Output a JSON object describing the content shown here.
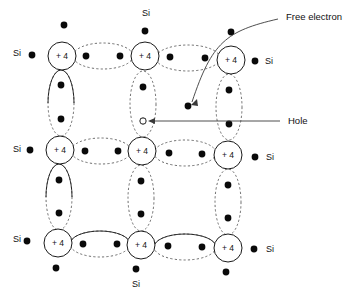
{
  "figure": {
    "background_color": "#ffffff",
    "line_color": "#1a1a1a",
    "dash_color": "#4a4a4a",
    "dot_color": "#0a0a0a"
  },
  "atoms": [
    {
      "id": "atom-r0c0",
      "label": "+ 4",
      "cx": 62,
      "cy": 56,
      "r": 14
    },
    {
      "id": "atom-r0c1",
      "label": "+ 4",
      "cx": 145,
      "cy": 56,
      "r": 14
    },
    {
      "id": "atom-r0c2",
      "label": "+ 4",
      "cx": 231,
      "cy": 60,
      "r": 14
    },
    {
      "id": "atom-r1c0",
      "label": "+ 4",
      "cx": 60,
      "cy": 150,
      "r": 14
    },
    {
      "id": "atom-r1c1",
      "label": "+ 4",
      "cx": 142,
      "cy": 151,
      "r": 14
    },
    {
      "id": "atom-r1c2",
      "label": "+ 4",
      "cx": 228,
      "cy": 155,
      "r": 14
    },
    {
      "id": "atom-r2c0",
      "label": "+ 4",
      "cx": 58,
      "cy": 243,
      "r": 14
    },
    {
      "id": "atom-r2c1",
      "label": "+ 4",
      "cx": 141,
      "cy": 245,
      "r": 14
    },
    {
      "id": "atom-r2c2",
      "label": "+ 4",
      "cx": 228,
      "cy": 248,
      "r": 14
    }
  ],
  "si_labels": [
    {
      "id": "si-top",
      "text": "Si",
      "x": 146,
      "y": 14
    },
    {
      "id": "si-left-top",
      "text": "Si",
      "x": 17,
      "y": 54
    },
    {
      "id": "si-right-top",
      "text": "Si",
      "x": 269,
      "y": 62
    },
    {
      "id": "si-left-middle",
      "text": "Si",
      "x": 17,
      "y": 150
    },
    {
      "id": "si-right-middle",
      "text": "Si",
      "x": 270,
      "y": 158
    },
    {
      "id": "si-left-bottom",
      "text": "Si",
      "x": 17,
      "y": 240
    },
    {
      "id": "si-right-bottom",
      "text": "Si",
      "x": 270,
      "y": 250
    },
    {
      "id": "si-bottom",
      "text": "Si",
      "x": 136,
      "y": 285
    }
  ],
  "callouts": [
    {
      "id": "free-electron-callout",
      "label": "Free electron",
      "label_x": 286,
      "label_y": 17,
      "target_x": 190,
      "target_y": 104
    },
    {
      "id": "hole-callout",
      "label": "Hole",
      "label_x": 288,
      "label_y": 121,
      "target_x": 150,
      "target_y": 121
    }
  ],
  "free_electron": {
    "id": "free-electron",
    "cx": 188,
    "cy": 106,
    "r": 3.4
  },
  "hole": {
    "id": "hole",
    "cx": 143,
    "cy": 121,
    "r": 3.0
  },
  "horizontal_bonds": [
    {
      "id": "bond-h-r0-c0c1",
      "cx": 103,
      "cy": 56,
      "rx": 30,
      "ry": 13,
      "style": "dashed",
      "dots": [
        {
          "x": 86,
          "y": 56
        },
        {
          "x": 120,
          "y": 56
        }
      ]
    },
    {
      "id": "bond-h-r0-c1c2",
      "cx": 188,
      "cy": 58,
      "rx": 32,
      "ry": 13,
      "style": "dashed",
      "dots": [
        {
          "x": 170,
          "y": 57
        },
        {
          "x": 205,
          "y": 58
        }
      ]
    },
    {
      "id": "bond-h-r1-c0c1",
      "cx": 101,
      "cy": 151,
      "rx": 30,
      "ry": 13,
      "style": "dashed",
      "dots": [
        {
          "x": 85,
          "y": 151
        },
        {
          "x": 118,
          "y": 151
        }
      ]
    },
    {
      "id": "bond-h-r1-c1c2",
      "cx": 185,
      "cy": 153,
      "rx": 31,
      "ry": 13,
      "style": "dashed",
      "dots": [
        {
          "x": 169,
          "y": 153
        },
        {
          "x": 202,
          "y": 154
        }
      ]
    },
    {
      "id": "bond-h-r2-c0c1",
      "cx": 100,
      "cy": 244,
      "rx": 30,
      "ry": 13,
      "style": "mixed",
      "dots": [
        {
          "x": 83,
          "y": 244
        },
        {
          "x": 117,
          "y": 244
        }
      ]
    },
    {
      "id": "bond-h-r2-c1c2",
      "cx": 185,
      "cy": 247,
      "rx": 31,
      "ry": 13,
      "style": "mixed",
      "dots": [
        {
          "x": 168,
          "y": 246
        },
        {
          "x": 202,
          "y": 247
        }
      ]
    }
  ],
  "vertical_bonds": [
    {
      "id": "bond-v-c0-r0r1",
      "cx": 61,
      "cy": 103,
      "rx": 13,
      "ry": 33,
      "style": "mixed",
      "dots": [
        {
          "x": 61,
          "y": 85
        },
        {
          "x": 61,
          "y": 119
        }
      ]
    },
    {
      "id": "bond-v-c1-r0r1",
      "cx": 143,
      "cy": 104,
      "rx": 13,
      "ry": 33,
      "style": "dashed",
      "dots": [
        {
          "x": 143,
          "y": 87
        },
        {
          "x": 143,
          "y": 121
        }
      ]
    },
    {
      "id": "bond-v-c2-r0r1",
      "cx": 229,
      "cy": 107,
      "rx": 13,
      "ry": 33,
      "style": "dashed",
      "dots": [
        {
          "x": 229,
          "y": 90
        },
        {
          "x": 229,
          "y": 124
        }
      ]
    },
    {
      "id": "bond-v-c0-r1r2",
      "cx": 59,
      "cy": 197,
      "rx": 13,
      "ry": 33,
      "style": "mixed",
      "dots": [
        {
          "x": 59,
          "y": 180
        },
        {
          "x": 59,
          "y": 213
        }
      ]
    },
    {
      "id": "bond-v-c1-r1r2",
      "cx": 141,
      "cy": 198,
      "rx": 13,
      "ry": 33,
      "style": "dashed",
      "dots": [
        {
          "x": 141,
          "y": 181
        },
        {
          "x": 141,
          "y": 214
        }
      ]
    },
    {
      "id": "bond-v-c2-r1r2",
      "cx": 228,
      "cy": 202,
      "rx": 13,
      "ry": 33,
      "style": "dashed",
      "dots": [
        {
          "x": 228,
          "y": 185
        },
        {
          "x": 228,
          "y": 218
        }
      ]
    }
  ],
  "outer_dots": [
    {
      "id": "outer-dot-top-c0",
      "x": 64,
      "y": 25
    },
    {
      "id": "outer-dot-top-c1",
      "x": 145,
      "y": 31
    },
    {
      "id": "outer-dot-top-c2",
      "x": 231,
      "y": 32
    },
    {
      "id": "outer-dot-left-r0",
      "x": 32,
      "y": 55
    },
    {
      "id": "outer-dot-left-r1",
      "x": 30,
      "y": 150
    },
    {
      "id": "outer-dot-left-r2",
      "x": 27,
      "y": 241
    },
    {
      "id": "outer-dot-right-r0",
      "x": 255,
      "y": 61
    },
    {
      "id": "outer-dot-right-r1",
      "x": 255,
      "y": 157
    },
    {
      "id": "outer-dot-right-r2",
      "x": 254,
      "y": 249
    },
    {
      "id": "outer-dot-bottom-c0",
      "x": 56,
      "y": 268
    },
    {
      "id": "outer-dot-bottom-c1",
      "x": 136,
      "y": 269
    },
    {
      "id": "outer-dot-bottom-c2",
      "x": 226,
      "y": 272
    }
  ]
}
